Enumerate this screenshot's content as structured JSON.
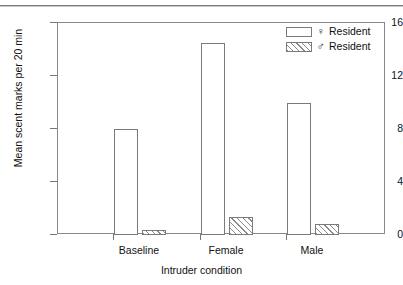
{
  "figure": {
    "background": "#ffffff",
    "frame_color": "#888888",
    "bar_edge_color": "#7a7a7a",
    "hatch_color": "#8a8a8a"
  },
  "legend": {
    "position": "top-right",
    "entries": [
      {
        "symbol": "♀",
        "symbol_name": "female-symbol",
        "label": "Resident",
        "fill": "open"
      },
      {
        "symbol": "♂",
        "symbol_name": "male-symbol",
        "label": "Resident",
        "fill": "hatched"
      }
    ]
  },
  "chart_data": {
    "type": "bar",
    "title": "",
    "xlabel": "Intruder condition",
    "ylabel": "Mean scent marks per 20 min",
    "categories": [
      "Baseline",
      "Female",
      "Male"
    ],
    "series": [
      {
        "name": "♀ Resident",
        "fill": "open",
        "values": [
          8.0,
          14.5,
          10.0
        ]
      },
      {
        "name": "♂ Resident",
        "fill": "hatched",
        "values": [
          0.4,
          1.35,
          0.85
        ]
      }
    ],
    "ylim": [
      0,
      16
    ],
    "yticks": [
      0,
      4,
      8,
      12,
      16
    ],
    "ytick_labels": [
      "0",
      "4",
      "8",
      "12",
      "16"
    ],
    "grid": false,
    "legend_position": "upper right"
  }
}
